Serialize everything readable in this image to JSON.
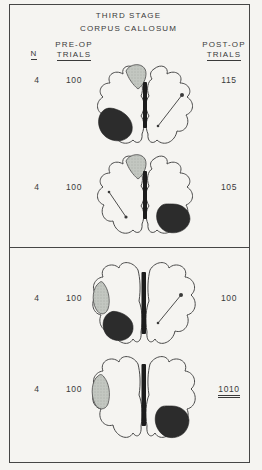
{
  "figure": {
    "title_line1": "THIRD STAGE",
    "title_line2": "CORPUS CALLOSUM",
    "columns": {
      "n": "N",
      "pre_op_line1": "PRE-OP",
      "pre_op_line2": "TRIALS",
      "post_op_line1": "POST-OP",
      "post_op_line2": "TRIALS"
    },
    "rows": [
      {
        "panel": 1,
        "n": "4",
        "pre_op": "100",
        "post_op": "115",
        "post_op_underline": "none",
        "brain": {
          "gray_patch": "left-hemisphere-top",
          "dark_patch": "left-hemisphere-bottom",
          "arrow": "right-hemisphere",
          "midline_bar": "present"
        }
      },
      {
        "panel": 1,
        "n": "4",
        "pre_op": "100",
        "post_op": "105",
        "post_op_underline": "none",
        "brain": {
          "gray_patch": "left-hemisphere-top",
          "dark_patch": "right-hemisphere-bottom",
          "arrow": "left-hemisphere",
          "midline_bar": "present"
        }
      },
      {
        "panel": 2,
        "n": "4",
        "pre_op": "100",
        "post_op": "100",
        "post_op_underline": "none",
        "brain": {
          "gray_patch": "left-hemisphere-edge",
          "dark_patch": "left-hemisphere-bottom",
          "arrow": "right-hemisphere",
          "midline_bar": "present"
        }
      },
      {
        "panel": 2,
        "n": "4",
        "pre_op": "100",
        "post_op": "1010",
        "post_op_underline": "double",
        "brain": {
          "gray_patch": "left-hemisphere-edge",
          "dark_patch": "right-hemisphere-bottom",
          "arrow": "none",
          "midline_bar": "present"
        }
      }
    ],
    "colors": {
      "ink": "#3a3a3a",
      "paper": "#f5f4f1",
      "border": "#464646",
      "gray_patch": "#c3c7c1",
      "dark_patch": "#2c2c2c",
      "bar": "#1c1c1c"
    }
  }
}
